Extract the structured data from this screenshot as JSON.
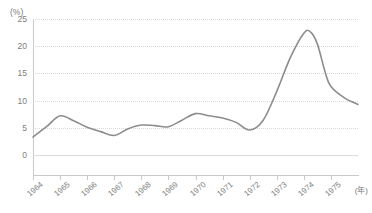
{
  "chart_data": {
    "type": "line",
    "title": "",
    "xlabel": "(年)",
    "ylabel": "(%)",
    "y_unit_label": "(%)",
    "x_unit_label": "(年)",
    "grid": true,
    "legend": "none",
    "line_color": "#8c8c8c",
    "grid_color": "#d9d9d9",
    "axis_color": "#c9c9c9",
    "text_color": "#7d7d7d",
    "xlim": [
      1964,
      1976
    ],
    "ylim": [
      0,
      25
    ],
    "ytick_labels": [
      "25",
      "20",
      "15",
      "10",
      "5",
      "0"
    ],
    "ytick_values": [
      25,
      20,
      15,
      10,
      5,
      0
    ],
    "categories": [
      "1964",
      "1965",
      "1966",
      "1967",
      "1968",
      "1969",
      "1970",
      "1971",
      "1972",
      "1973",
      "1974",
      "1975"
    ],
    "series": [
      {
        "name": "",
        "values": [
          3.3,
          7.2,
          5.1,
          3.6,
          5.5,
          5.2,
          7.6,
          6.8,
          4.6,
          11.7,
          22.6,
          11.0
        ]
      }
    ],
    "points": [
      {
        "x": 1964.0,
        "y": 3.3
      },
      {
        "x": 1964.5,
        "y": 5.2
      },
      {
        "x": 1965.0,
        "y": 7.2
      },
      {
        "x": 1965.5,
        "y": 6.3
      },
      {
        "x": 1966.0,
        "y": 5.1
      },
      {
        "x": 1966.5,
        "y": 4.3
      },
      {
        "x": 1967.0,
        "y": 3.6
      },
      {
        "x": 1967.5,
        "y": 4.8
      },
      {
        "x": 1968.0,
        "y": 5.5
      },
      {
        "x": 1968.5,
        "y": 5.4
      },
      {
        "x": 1969.0,
        "y": 5.2
      },
      {
        "x": 1969.5,
        "y": 6.4
      },
      {
        "x": 1970.0,
        "y": 7.6
      },
      {
        "x": 1970.5,
        "y": 7.2
      },
      {
        "x": 1971.0,
        "y": 6.8
      },
      {
        "x": 1971.5,
        "y": 6.0
      },
      {
        "x": 1972.0,
        "y": 4.6
      },
      {
        "x": 1972.5,
        "y": 6.4
      },
      {
        "x": 1973.0,
        "y": 11.7
      },
      {
        "x": 1973.5,
        "y": 17.9
      },
      {
        "x": 1974.0,
        "y": 22.4
      },
      {
        "x": 1974.25,
        "y": 22.6
      },
      {
        "x": 1974.5,
        "y": 20.4
      },
      {
        "x": 1974.8,
        "y": 15.0
      },
      {
        "x": 1975.0,
        "y": 12.6
      },
      {
        "x": 1975.5,
        "y": 10.5
      },
      {
        "x": 1976.0,
        "y": 9.3
      }
    ]
  }
}
